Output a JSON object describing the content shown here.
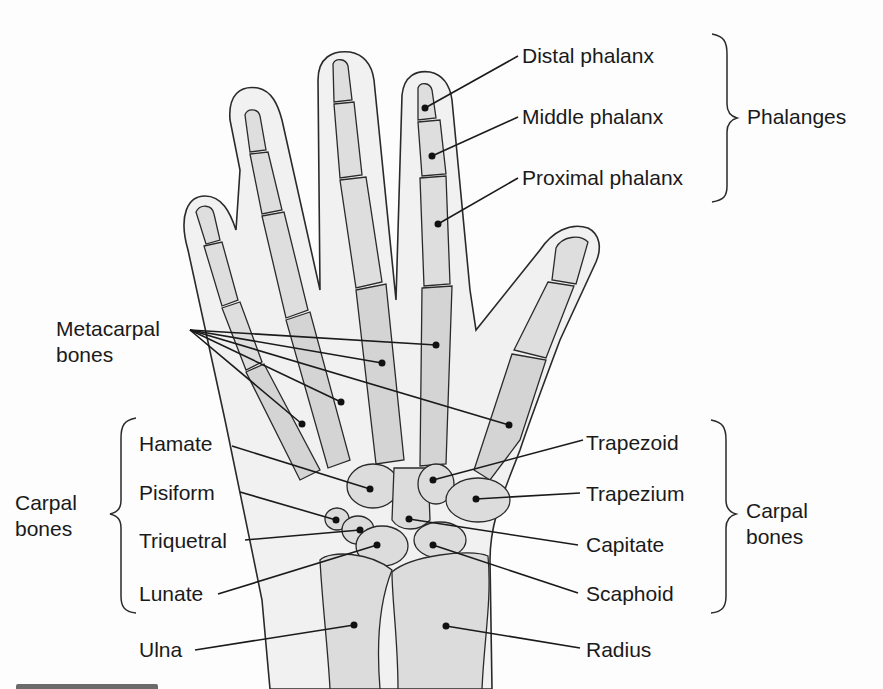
{
  "diagram": {
    "colors": {
      "background": "#fdfdfd",
      "skin": "#f1f1f1",
      "bone": "#dedede",
      "bone_shade": "#c4c4c4",
      "outline": "#2a2a2a",
      "text": "#1a1a1a"
    },
    "groups": {
      "phalanges": "Phalanges",
      "carpal_left_line1": "Carpal",
      "carpal_left_line2": "bones",
      "carpal_right_line1": "Carpal",
      "carpal_right_line2": "bones",
      "metacarpal_line1": "Metacarpal",
      "metacarpal_line2": "bones"
    },
    "labels": {
      "distal_phalanx": "Distal phalanx",
      "middle_phalanx": "Middle phalanx",
      "proximal_phalanx": "Proximal phalanx",
      "hamate": "Hamate",
      "pisiform": "Pisiform",
      "triquetral": "Triquetral",
      "lunate": "Lunate",
      "ulna": "Ulna",
      "trapezoid": "Trapezoid",
      "trapezium": "Trapezium",
      "capitate": "Capitate",
      "scaphoid": "Scaphoid",
      "radius": "Radius"
    }
  }
}
